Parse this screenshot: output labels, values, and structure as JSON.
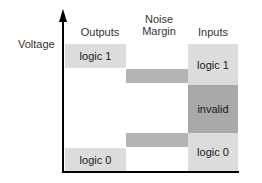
{
  "diagram": {
    "y_axis_label": "Voltage",
    "columns": {
      "outputs": "Outputs",
      "noise_margin": "Noise\nMargin",
      "noise_margin_line1": "Noise",
      "noise_margin_line2": "Margin",
      "inputs": "Inputs"
    },
    "regions": {
      "output_logic1": "logic 1",
      "output_logic0": "logic 0",
      "input_logic1": "logic 1",
      "input_invalid": "invalid",
      "input_logic0": "logic 0"
    },
    "colors": {
      "logic_region": "#dcdcdc",
      "noise_margin": "#b4b4b4",
      "invalid_region": "#a9a9a9",
      "axis": "#000000"
    }
  }
}
